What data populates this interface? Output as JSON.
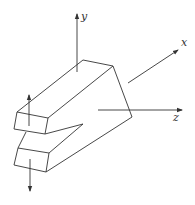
{
  "diagram": {
    "axes": {
      "x": {
        "label": "x"
      },
      "y": {
        "label": "y"
      },
      "z": {
        "label": "z"
      }
    },
    "forces": [
      {
        "name": "upper-force",
        "direction": "up"
      },
      {
        "name": "lower-force",
        "direction": "down"
      }
    ],
    "colors": {
      "line": "#333333",
      "background": "#ffffff"
    }
  }
}
